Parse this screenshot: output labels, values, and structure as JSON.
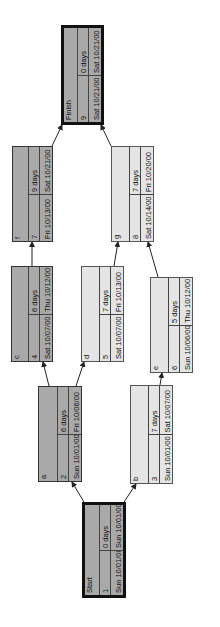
{
  "diagram": {
    "type": "network-diagram",
    "orientation": "rotated-90-ccw",
    "colors": {
      "critical_fill": "#a9a9a9",
      "noncritical_fill": "#e4e4e4",
      "border": "#222222",
      "background": "#ffffff"
    },
    "nodes": [
      {
        "key": "start",
        "name": "Start",
        "id": "1",
        "duration": "0 days",
        "start": "Sun 10/01/00",
        "finish": "Sun 10/01/00",
        "critical": true,
        "milestone": true
      },
      {
        "key": "a",
        "name": "a",
        "id": "2",
        "duration": "6 days",
        "start": "Sun 10/01/00",
        "finish": "Fri 10/06/00",
        "critical": true,
        "milestone": false
      },
      {
        "key": "b",
        "name": "b",
        "id": "3",
        "duration": "7 days",
        "start": "Sun 10/01/00",
        "finish": "Sat 10/07/00",
        "critical": false,
        "milestone": false
      },
      {
        "key": "c",
        "name": "c",
        "id": "4",
        "duration": "6 days",
        "start": "Sat 10/07/00",
        "finish": "Thu 10/12/00",
        "critical": true,
        "milestone": false
      },
      {
        "key": "d",
        "name": "d",
        "id": "5",
        "duration": "7 days",
        "start": "Sat 10/07/00",
        "finish": "Fri 10/13/00",
        "critical": false,
        "milestone": false
      },
      {
        "key": "e",
        "name": "e",
        "id": "6",
        "duration": "5 days",
        "start": "Sun 10/06/00",
        "finish": "Thu 10/12/00",
        "critical": false,
        "milestone": false
      },
      {
        "key": "f",
        "name": "f",
        "id": "7",
        "duration": "9 days",
        "start": "Fri 10/13/00",
        "finish": "Sat 10/21/00",
        "critical": true,
        "milestone": false
      },
      {
        "key": "g",
        "name": "g",
        "id": "8",
        "duration": "7 days",
        "start": "Sat 10/14/00",
        "finish": "Fri 10/20/00",
        "critical": false,
        "milestone": false
      },
      {
        "key": "finish",
        "name": "Finish",
        "id": "9",
        "duration": "0 days",
        "start": "Sat 10/21/00",
        "finish": "Sat 10/21/00",
        "critical": true,
        "milestone": true
      }
    ],
    "links": [
      {
        "from": "start",
        "to": "a"
      },
      {
        "from": "start",
        "to": "b"
      },
      {
        "from": "a",
        "to": "c"
      },
      {
        "from": "a",
        "to": "d"
      },
      {
        "from": "b",
        "to": "e"
      },
      {
        "from": "c",
        "to": "f"
      },
      {
        "from": "d",
        "to": "g"
      },
      {
        "from": "e",
        "to": "g"
      },
      {
        "from": "f",
        "to": "finish"
      },
      {
        "from": "g",
        "to": "finish"
      }
    ]
  }
}
